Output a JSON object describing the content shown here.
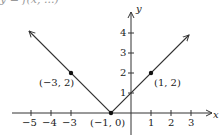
{
  "caption_fragment": "y = f(x, ...)",
  "chart_data": {
    "type": "line",
    "title": "",
    "function": "y = |x + 1|",
    "xlabel": "x",
    "ylabel": "y",
    "xlim": [
      -5.5,
      4
    ],
    "ylim": [
      -0.5,
      4.8
    ],
    "grid": false,
    "x_ticks": [
      -5,
      -4,
      -3,
      1,
      2,
      3
    ],
    "x_tick_labels": [
      "−5",
      "−4",
      "−3",
      "1",
      "2",
      "3"
    ],
    "y_ticks": [
      1,
      2,
      3,
      4
    ],
    "y_tick_labels": [
      "1",
      "2",
      "3",
      "4"
    ],
    "series": [
      {
        "name": "y = |x+1|",
        "x": [
          -5.1,
          -1,
          2.9
        ],
        "y": [
          4.1,
          0,
          3.9
        ],
        "arrows_both_ends": true
      }
    ],
    "points": [
      {
        "x": -3,
        "y": 2,
        "label": "(−3, 2)"
      },
      {
        "x": -1,
        "y": 0,
        "label": "(−1, 0)"
      },
      {
        "x": 1,
        "y": 2,
        "label": "(1, 2)"
      }
    ],
    "colors": {
      "line": "#333333",
      "axis": "#333333",
      "point": "#111111"
    }
  }
}
